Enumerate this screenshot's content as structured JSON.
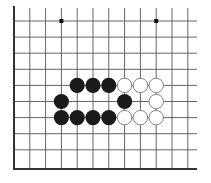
{
  "diagram": {
    "type": "go-board-fragment",
    "edges": {
      "left": true,
      "bottom": true,
      "top": false,
      "right": false
    },
    "columns": 11,
    "rows": 10,
    "colors": {
      "line": "#555555",
      "edge": "#333333",
      "black": "#1a1a1a",
      "white": "#ffffff",
      "white_outline": "#777777",
      "background": "#ffffff"
    },
    "star_points": [
      {
        "col": 3,
        "row": 0
      },
      {
        "col": 9,
        "row": 0
      }
    ],
    "stones": [
      {
        "color": "black",
        "col": 4,
        "row": 4
      },
      {
        "color": "black",
        "col": 5,
        "row": 4
      },
      {
        "color": "black",
        "col": 6,
        "row": 4
      },
      {
        "color": "white",
        "col": 7,
        "row": 4
      },
      {
        "color": "white",
        "col": 8,
        "row": 4
      },
      {
        "color": "white",
        "col": 9,
        "row": 4
      },
      {
        "color": "black",
        "col": 3,
        "row": 5
      },
      {
        "color": "black",
        "col": 7,
        "row": 5
      },
      {
        "color": "white",
        "col": 9,
        "row": 5
      },
      {
        "color": "black",
        "col": 3,
        "row": 6
      },
      {
        "color": "black",
        "col": 4,
        "row": 6
      },
      {
        "color": "black",
        "col": 5,
        "row": 6
      },
      {
        "color": "black",
        "col": 6,
        "row": 6
      },
      {
        "color": "white",
        "col": 7,
        "row": 6
      },
      {
        "color": "white",
        "col": 8,
        "row": 6
      },
      {
        "color": "white",
        "col": 9,
        "row": 6
      }
    ]
  }
}
